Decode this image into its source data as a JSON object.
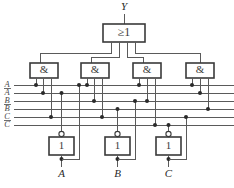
{
  "diagram": {
    "output": {
      "name": "Y",
      "label": "Y"
    },
    "or_gate": {
      "label": "≥1",
      "name": "or-gate",
      "inputs": 4,
      "x": 103,
      "y": 24,
      "w": 42,
      "h": 18
    },
    "and_gates": [
      {
        "label": "&",
        "name": "and-gate-1",
        "x": 30,
        "y": 63,
        "w": 28,
        "h": 15
      },
      {
        "label": "&",
        "name": "and-gate-2",
        "x": 81,
        "y": 63,
        "w": 28,
        "h": 15
      },
      {
        "label": "&",
        "name": "and-gate-3",
        "x": 133,
        "y": 63,
        "w": 28,
        "h": 15
      },
      {
        "label": "&",
        "name": "and-gate-4",
        "x": 186,
        "y": 63,
        "w": 28,
        "h": 15
      }
    ],
    "inverters": [
      {
        "label": "1",
        "name": "inverter-a",
        "x": 49,
        "y": 137,
        "w": 25,
        "h": 18,
        "input": "A"
      },
      {
        "label": "1",
        "name": "inverter-b",
        "x": 105,
        "y": 137,
        "w": 25,
        "h": 18,
        "input": "B"
      },
      {
        "label": "1",
        "name": "inverter-c",
        "x": 156,
        "y": 137,
        "w": 25,
        "h": 18,
        "input": "C"
      }
    ],
    "bus_labels": [
      {
        "text": "A",
        "overbar": false,
        "y": 85
      },
      {
        "text": "A",
        "overbar": true,
        "y": 93
      },
      {
        "text": "B",
        "overbar": false,
        "y": 101
      },
      {
        "text": "B",
        "overbar": true,
        "y": 109
      },
      {
        "text": "C",
        "overbar": false,
        "y": 117
      },
      {
        "text": "C",
        "overbar": true,
        "y": 125
      }
    ],
    "inputs": [
      {
        "label": "A",
        "name": "input-a",
        "x": 61,
        "y": 174
      },
      {
        "label": "B",
        "name": "input-b",
        "x": 117,
        "y": 174
      },
      {
        "label": "C",
        "name": "input-c",
        "x": 168,
        "y": 174
      }
    ],
    "colors": {
      "wire": "#5a5a5a",
      "gate_stroke": "#3a3a3a",
      "junction": "#2a2a2a",
      "background": "#ffffff"
    }
  }
}
